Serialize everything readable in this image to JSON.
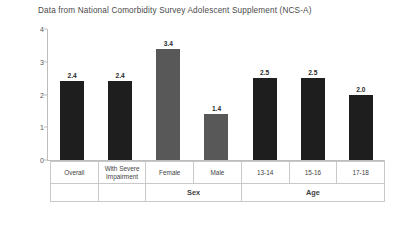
{
  "chart_data": {
    "type": "bar",
    "title": "Data from National Comorbidity Survey Adolescent Supplement (NCS-A)",
    "xlabel": "",
    "ylabel": "Percent",
    "ylim": [
      0,
      4
    ],
    "yticks": [
      "0",
      "1",
      "2",
      "3",
      "4"
    ],
    "grid": false,
    "legend": "none",
    "categories": [
      "Overall",
      "With Severe Impairment",
      "Female",
      "Male",
      "13-14",
      "15-16",
      "17-18"
    ],
    "values": [
      2.4,
      2.4,
      3.4,
      1.4,
      2.5,
      2.5,
      2.0
    ],
    "value_labels": [
      "2.4",
      "2.4",
      "3.4",
      "1.4",
      "2.5",
      "2.5",
      "2.0"
    ],
    "bar_colors": [
      "#1e1e1e",
      "#1e1e1e",
      "#585858",
      "#585858",
      "#1e1e1e",
      "#1e1e1e",
      "#1e1e1e"
    ],
    "groups": [
      {
        "label": "",
        "span": 1
      },
      {
        "label": "",
        "span": 1
      },
      {
        "label": "Sex",
        "span": 2
      },
      {
        "label": "Age",
        "span": 3
      }
    ]
  },
  "colors": {
    "dark_bar": "#1e1e1e",
    "gray_bar": "#585858",
    "axis": "#bdbdbd",
    "table_border": "#c9c9c9",
    "text": "#3a3a3a",
    "background": "#ffffff"
  }
}
